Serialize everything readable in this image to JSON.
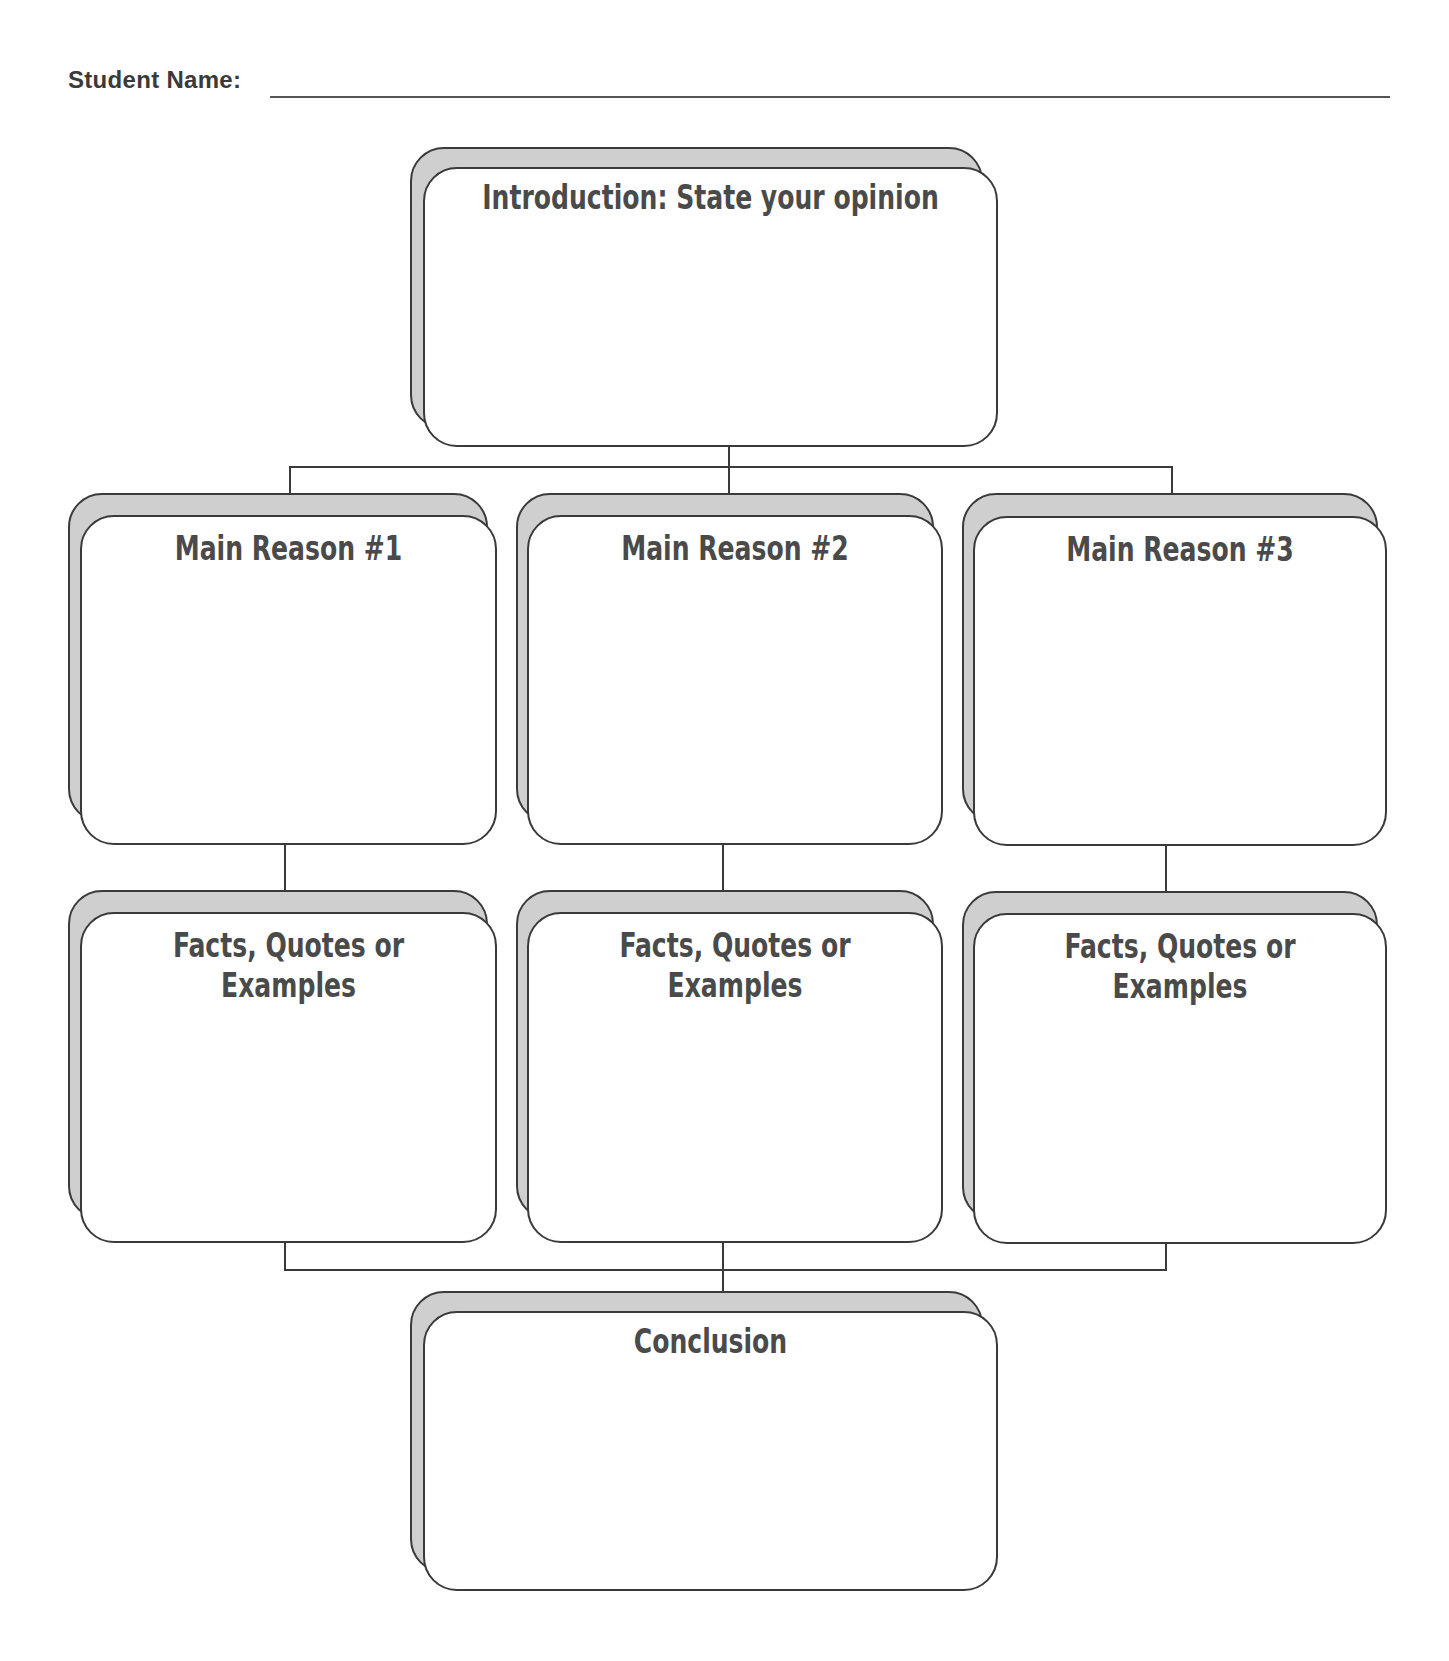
{
  "header": {
    "student_name_label": "Student Name:",
    "student_name_value": ""
  },
  "organizer": {
    "introduction": {
      "title": "Introduction: State your opinion"
    },
    "main_reasons": [
      {
        "title": "Main Reason #1"
      },
      {
        "title": "Main Reason #2"
      },
      {
        "title": "Main Reason #3"
      }
    ],
    "supports": [
      {
        "title": "Facts, Quotes or Examples"
      },
      {
        "title": "Facts, Quotes or Examples"
      },
      {
        "title": "Facts, Quotes or Examples"
      }
    ],
    "conclusion": {
      "title": "Conclusion"
    }
  },
  "colors": {
    "outline": "#3a3a3a",
    "shadow_card": "#cfcfcf",
    "title_text": "#4a4a4a"
  }
}
